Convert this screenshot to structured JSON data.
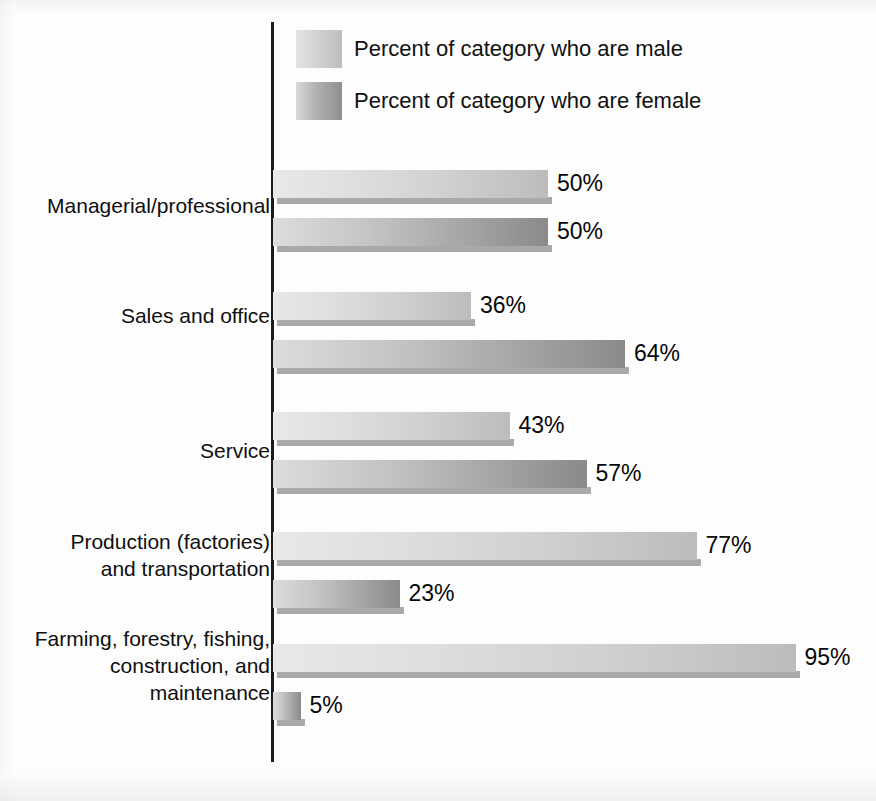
{
  "legend": {
    "items": [
      {
        "key": "male",
        "label": "Percent of category who are male",
        "swatch": "#cfcfcf"
      },
      {
        "key": "female",
        "label": "Percent of category who are female",
        "swatch": "#a5a5a5"
      }
    ]
  },
  "rows": [
    {
      "category": "Managerial/professional",
      "male_label": "50%",
      "female_label": "50%"
    },
    {
      "category": "Sales and office",
      "male_label": "36%",
      "female_label": "64%"
    },
    {
      "category": "Service",
      "male_label": "43%",
      "female_label": "57%"
    },
    {
      "category": "Production (factories)\nand transportation",
      "male_label": "77%",
      "female_label": "23%"
    },
    {
      "category": "Farming, forestry, fishing,\nconstruction, and\nmaintenance",
      "male_label": "95%",
      "female_label": "5%"
    }
  ],
  "chart_data": {
    "type": "bar",
    "orientation": "horizontal",
    "title": "",
    "xlabel": "",
    "ylabel": "",
    "xlim": [
      0,
      100
    ],
    "grid": false,
    "legend_position": "top-left",
    "categories": [
      "Managerial/professional",
      "Sales and office",
      "Service",
      "Production (factories) and transportation",
      "Farming, forestry, fishing, construction, and maintenance"
    ],
    "series": [
      {
        "name": "Percent of category who are male",
        "color": "#cfcfcf",
        "values": [
          50,
          36,
          43,
          77,
          95
        ],
        "value_labels": [
          "50%",
          "36%",
          "43%",
          "77%",
          "95%"
        ]
      },
      {
        "name": "Percent of category who are female",
        "color": "#a5a5a5",
        "values": [
          50,
          64,
          57,
          23,
          5
        ],
        "value_labels": [
          "50%",
          "64%",
          "57%",
          "23%",
          "5%"
        ]
      }
    ],
    "units": "percent"
  }
}
